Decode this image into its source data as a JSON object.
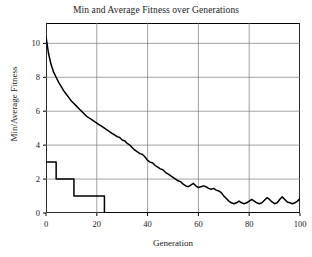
{
  "chart_data": {
    "type": "line",
    "title": "Min and Average Fitness over Generations",
    "xlabel": "Generation",
    "ylabel": "Min/Average Fitness",
    "xlim": [
      0,
      100
    ],
    "ylim": [
      0,
      11.2
    ],
    "xticks": [
      0,
      20,
      40,
      60,
      80,
      100
    ],
    "yticks": [
      0,
      2,
      4,
      6,
      8,
      10
    ],
    "grid": true,
    "legend": "none",
    "line_color": "#000000",
    "x": [
      0,
      1,
      2,
      3,
      4,
      5,
      6,
      7,
      8,
      9,
      10,
      11,
      12,
      13,
      14,
      15,
      16,
      17,
      18,
      19,
      20,
      21,
      22,
      23,
      24,
      25,
      26,
      27,
      28,
      29,
      30,
      31,
      32,
      33,
      34,
      35,
      36,
      37,
      38,
      39,
      40,
      41,
      42,
      43,
      44,
      45,
      46,
      47,
      48,
      49,
      50,
      51,
      52,
      53,
      54,
      55,
      56,
      57,
      58,
      59,
      60,
      61,
      62,
      63,
      64,
      65,
      66,
      67,
      68,
      69,
      70,
      71,
      72,
      73,
      74,
      75,
      76,
      77,
      78,
      79,
      80,
      81,
      82,
      83,
      84,
      85,
      86,
      87,
      88,
      89,
      90,
      91,
      92,
      93,
      94,
      95,
      96,
      97,
      98,
      99,
      100
    ],
    "series": [
      {
        "name": "Average Fitness",
        "style": "smooth-noisy",
        "values": [
          10.4,
          9.4,
          8.75,
          8.3,
          8.0,
          7.7,
          7.45,
          7.2,
          7.0,
          6.8,
          6.6,
          6.45,
          6.3,
          6.15,
          6.0,
          5.85,
          5.7,
          5.6,
          5.5,
          5.4,
          5.3,
          5.2,
          5.1,
          5.0,
          4.9,
          4.8,
          4.7,
          4.6,
          4.5,
          4.45,
          4.3,
          4.25,
          4.1,
          4.0,
          3.85,
          3.7,
          3.6,
          3.5,
          3.45,
          3.3,
          3.1,
          3.0,
          2.95,
          2.8,
          2.7,
          2.6,
          2.55,
          2.4,
          2.3,
          2.2,
          2.1,
          2.0,
          1.9,
          1.85,
          1.7,
          1.6,
          1.55,
          1.65,
          1.75,
          1.6,
          1.5,
          1.55,
          1.6,
          1.55,
          1.45,
          1.4,
          1.45,
          1.35,
          1.3,
          1.2,
          1.0,
          0.85,
          0.7,
          0.6,
          0.55,
          0.6,
          0.7,
          0.6,
          0.55,
          0.6,
          0.7,
          0.8,
          0.7,
          0.6,
          0.55,
          0.6,
          0.75,
          0.9,
          0.8,
          0.65,
          0.55,
          0.6,
          0.8,
          0.95,
          0.8,
          0.65,
          0.6,
          0.55,
          0.6,
          0.7,
          0.85
        ]
      },
      {
        "name": "Min Fitness",
        "style": "step",
        "values": [
          3,
          3,
          3,
          3,
          2,
          2,
          2,
          2,
          2,
          2,
          2,
          1,
          1,
          1,
          1,
          1,
          1,
          1,
          1,
          1,
          1,
          1,
          1,
          0,
          0,
          0,
          0,
          0,
          0,
          0,
          0,
          0,
          0,
          0,
          0,
          0,
          0,
          0,
          0,
          0,
          0,
          0,
          0,
          0,
          0,
          0,
          0,
          0,
          0,
          0,
          0,
          0,
          0,
          0,
          0,
          0,
          0,
          0,
          0,
          0,
          0,
          0,
          0,
          0,
          0,
          0,
          0,
          0,
          0,
          0,
          0,
          0,
          0,
          0,
          0,
          0,
          0,
          0,
          0,
          0,
          0,
          0,
          0,
          0,
          0,
          0,
          0,
          0,
          0,
          0,
          0,
          0,
          0,
          0,
          0,
          0,
          0,
          0,
          0,
          0,
          0
        ]
      }
    ]
  }
}
